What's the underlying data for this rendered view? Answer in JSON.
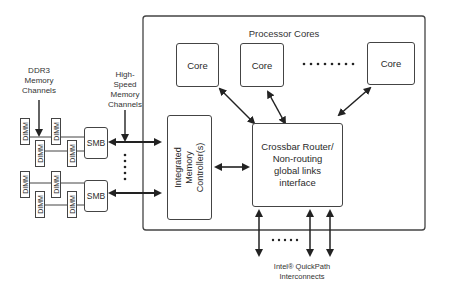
{
  "diagram": {
    "processor": {
      "title": "Processor Cores",
      "cores": [
        {
          "label": "Core"
        },
        {
          "label": "Core"
        },
        {
          "label": "Core"
        }
      ],
      "core_ellipsis": "........"
    },
    "memory_controller": {
      "label": "Integrated Memory Controller(s)"
    },
    "crossbar": {
      "line1": "Crossbar Router/",
      "line2": "Non-routing",
      "line3": "global links",
      "line4": "interface"
    },
    "ddr3_label": {
      "line1": "DDR3",
      "line2": "Memory",
      "line3": "Channels"
    },
    "hs_label": {
      "line1": "High-",
      "line2": "Speed",
      "line3": "Memory",
      "line4": "Channels"
    },
    "smb": [
      {
        "label": "SMB"
      },
      {
        "label": "SMB"
      }
    ],
    "dimm_label": "DIMM",
    "qpi_label": {
      "line1": "Intel® QuickPath",
      "line2": "Interconnects"
    }
  }
}
